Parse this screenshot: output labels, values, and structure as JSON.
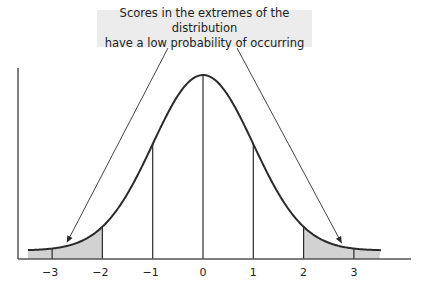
{
  "callout": {
    "line1": "Scores in the extremes of the distribution",
    "line2": "have a low probability of occurring"
  },
  "colors": {
    "curve": "#2b2b2b",
    "shade": "#d2d2d2",
    "callout_bg": "#ececec",
    "axis": "#555555"
  },
  "chart_data": {
    "type": "area",
    "title": "",
    "xlabel": "",
    "ylabel": "",
    "x_ticks": [
      -3,
      -2,
      -1,
      0,
      1,
      2,
      3
    ],
    "tick_labels": [
      "−3",
      "−2",
      "−1",
      "0",
      "1",
      "2",
      "3"
    ],
    "xlim": [
      -3.5,
      3.5
    ],
    "vertical_lines_at": [
      -3,
      -2,
      -1,
      0,
      1,
      2,
      3
    ],
    "shaded_regions": [
      {
        "from": -3.5,
        "to": -2,
        "label": "lower extreme"
      },
      {
        "from": 2,
        "to": 3.5,
        "label": "upper extreme"
      }
    ],
    "curve": {
      "distribution": "normal",
      "mean": 0,
      "sd": 1
    },
    "annotation": {
      "text": "Scores in the extremes of the distribution have a low probability of occurring",
      "points_to": [
        -2.7,
        2.75
      ]
    },
    "grid": false,
    "legend": "none"
  }
}
